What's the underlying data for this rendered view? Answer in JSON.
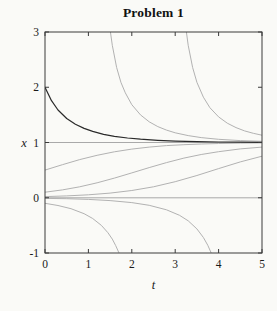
{
  "figure": {
    "title": "Problem 1"
  },
  "chart_data": {
    "type": "line",
    "title": "Problem 1",
    "xlabel": "t",
    "ylabel": "x",
    "xlim": [
      0,
      5
    ],
    "ylim": [
      -1,
      3
    ],
    "xticks": [
      0,
      1,
      2,
      3,
      4,
      5
    ],
    "xtick_labels": [
      "0",
      "1",
      "2",
      "3",
      "4",
      "5"
    ],
    "yticks": [
      -1,
      0,
      1,
      2,
      3
    ],
    "ytick_labels": [
      "-1",
      "0",
      "1",
      "2",
      "3"
    ],
    "grid": false,
    "legend": "none",
    "axis_color": "#3a3a3a",
    "text_color": "#1a1a1a",
    "series": [
      {
        "name": "equilibrium-x-1",
        "color": "#a9a9a9",
        "width": 1,
        "points": [
          [
            0,
            1
          ],
          [
            5,
            1
          ]
        ]
      },
      {
        "name": "equilibrium-x-0",
        "color": "#a9a9a9",
        "width": 1,
        "points": [
          [
            0,
            0
          ],
          [
            5,
            0
          ]
        ]
      },
      {
        "name": "upper-branch-1",
        "color": "#b2b2b2",
        "width": 1,
        "points": [
          [
            1.48,
            3.16
          ],
          [
            1.55,
            2.76
          ],
          [
            1.65,
            2.36
          ],
          [
            1.75,
            2.09
          ],
          [
            1.85,
            1.9
          ],
          [
            2,
            1.685
          ],
          [
            2.2,
            1.499
          ],
          [
            2.4,
            1.375
          ],
          [
            2.6,
            1.287
          ],
          [
            2.8,
            1.224
          ],
          [
            3,
            1.176
          ],
          [
            3.3,
            1.125
          ],
          [
            3.6,
            1.089
          ],
          [
            4,
            1.058
          ],
          [
            4.5,
            1.035
          ],
          [
            5,
            1.021
          ]
        ]
      },
      {
        "name": "upper-branch-2",
        "color": "#b2b2b2",
        "width": 1,
        "points": [
          [
            3.23,
            3.16
          ],
          [
            3.3,
            2.76
          ],
          [
            3.4,
            2.36
          ],
          [
            3.5,
            2.09
          ],
          [
            3.65,
            1.82
          ],
          [
            3.8,
            1.63
          ],
          [
            4,
            1.463
          ],
          [
            4.2,
            1.35
          ],
          [
            4.4,
            1.269
          ],
          [
            4.6,
            1.21
          ],
          [
            4.8,
            1.166
          ],
          [
            5,
            1.132
          ]
        ]
      },
      {
        "name": "interior-solution-a",
        "color": "#b2b2b2",
        "width": 1,
        "points": [
          [
            0,
            0.5
          ],
          [
            0.4,
            0.599
          ],
          [
            0.8,
            0.69
          ],
          [
            1.2,
            0.769
          ],
          [
            1.6,
            0.832
          ],
          [
            2,
            0.881
          ],
          [
            2.4,
            0.917
          ],
          [
            2.8,
            0.943
          ],
          [
            3.2,
            0.961
          ],
          [
            3.6,
            0.973
          ],
          [
            4,
            0.982
          ],
          [
            4.5,
            0.989
          ],
          [
            5,
            0.993
          ]
        ]
      },
      {
        "name": "interior-solution-b",
        "color": "#b2b2b2",
        "width": 1,
        "points": [
          [
            0,
            0.1
          ],
          [
            0.4,
            0.142
          ],
          [
            0.8,
            0.198
          ],
          [
            1.2,
            0.27
          ],
          [
            1.6,
            0.355
          ],
          [
            2,
            0.45
          ],
          [
            2.4,
            0.546
          ],
          [
            2.8,
            0.637
          ],
          [
            3.2,
            0.717
          ],
          [
            3.6,
            0.783
          ],
          [
            4,
            0.834
          ],
          [
            4.5,
            0.884
          ],
          [
            5,
            0.917
          ]
        ]
      },
      {
        "name": "interior-solution-c",
        "color": "#b2b2b2",
        "width": 1,
        "points": [
          [
            0,
            0.02
          ],
          [
            0.5,
            0.033
          ],
          [
            1,
            0.053
          ],
          [
            1.5,
            0.084
          ],
          [
            2,
            0.131
          ],
          [
            2.5,
            0.199
          ],
          [
            3,
            0.291
          ],
          [
            3.5,
            0.403
          ],
          [
            4,
            0.527
          ],
          [
            4.5,
            0.648
          ],
          [
            5,
            0.752
          ]
        ]
      },
      {
        "name": "lower-branch-1",
        "color": "#b2b2b2",
        "width": 1,
        "points": [
          [
            0,
            -0.1
          ],
          [
            0.3,
            -0.14
          ],
          [
            0.6,
            -0.199
          ],
          [
            0.9,
            -0.288
          ],
          [
            1.1,
            -0.376
          ],
          [
            1.3,
            -0.5
          ],
          [
            1.45,
            -0.633
          ],
          [
            1.55,
            -0.749
          ],
          [
            1.63,
            -0.866
          ],
          [
            1.7,
            -0.991
          ],
          [
            1.72,
            -1.03
          ]
        ]
      },
      {
        "name": "lower-branch-2",
        "color": "#b2b2b2",
        "width": 1,
        "points": [
          [
            0,
            -0.011
          ],
          [
            0.5,
            -0.018
          ],
          [
            1,
            -0.03
          ],
          [
            1.5,
            -0.051
          ],
          [
            2,
            -0.087
          ],
          [
            2.4,
            -0.136
          ],
          [
            2.8,
            -0.218
          ],
          [
            3.1,
            -0.318
          ],
          [
            3.3,
            -0.418
          ],
          [
            3.5,
            -0.563
          ],
          [
            3.65,
            -0.72
          ],
          [
            3.75,
            -0.861
          ],
          [
            3.84,
            -1.02
          ]
        ]
      },
      {
        "name": "highlighted-solution-from-2",
        "color": "#2a2a2a",
        "width": 1.2,
        "points": [
          [
            0,
            2
          ],
          [
            0.15,
            1.756
          ],
          [
            0.3,
            1.588
          ],
          [
            0.5,
            1.435
          ],
          [
            0.7,
            1.33
          ],
          [
            0.9,
            1.255
          ],
          [
            1.1,
            1.2
          ],
          [
            1.35,
            1.149
          ],
          [
            1.6,
            1.112
          ],
          [
            1.9,
            1.081
          ],
          [
            2.2,
            1.059
          ],
          [
            2.6,
            1.039
          ],
          [
            3,
            1.026
          ],
          [
            3.5,
            1.015
          ],
          [
            4,
            1.009
          ],
          [
            4.5,
            1.006
          ],
          [
            5,
            1.003
          ]
        ]
      }
    ]
  }
}
